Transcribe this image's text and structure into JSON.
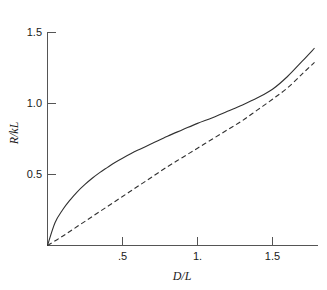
{
  "chart_data": {
    "type": "line",
    "title": "",
    "subtitle": "",
    "xlabel": "D/L",
    "ylabel": "R/kL",
    "xlim": [
      0,
      1.8
    ],
    "ylim": [
      0,
      1.5
    ],
    "grid": false,
    "legend": "none",
    "annotations": [],
    "xticks": [
      0.5,
      1.0,
      1.5
    ],
    "xtick_labels": [
      ".5",
      "1.",
      "1.5"
    ],
    "yticks": [
      0.5,
      1.0,
      1.5
    ],
    "ytick_labels": [
      "0.5",
      "1.0",
      "1.5"
    ],
    "series": [
      {
        "name": "solid-curve",
        "style": "solid",
        "color": "#303030",
        "x": [
          0,
          0.05,
          0.1,
          0.15,
          0.2,
          0.25,
          0.3,
          0.35,
          0.4,
          0.45,
          0.5,
          0.6,
          0.7,
          0.8,
          0.9,
          1.0,
          1.1,
          1.2,
          1.3,
          1.4,
          1.5,
          1.6,
          1.7,
          1.78
        ],
        "y": [
          0,
          0.16,
          0.25,
          0.32,
          0.38,
          0.43,
          0.475,
          0.515,
          0.55,
          0.585,
          0.615,
          0.67,
          0.72,
          0.77,
          0.815,
          0.86,
          0.9,
          0.945,
          0.99,
          1.04,
          1.1,
          1.19,
          1.3,
          1.39
        ]
      },
      {
        "name": "dashed-curve",
        "style": "dashed",
        "color": "#303030",
        "x": [
          0,
          0.1,
          0.2,
          0.3,
          0.4,
          0.5,
          0.6,
          0.7,
          0.8,
          0.9,
          1.0,
          1.1,
          1.2,
          1.3,
          1.4,
          1.5,
          1.6,
          1.7,
          1.78
        ],
        "y": [
          0,
          0.065,
          0.135,
          0.205,
          0.275,
          0.345,
          0.415,
          0.485,
          0.555,
          0.62,
          0.685,
          0.75,
          0.815,
          0.88,
          0.955,
          1.03,
          1.11,
          1.21,
          1.29
        ]
      }
    ]
  },
  "axes": {
    "x_axis_title": "D/L",
    "y_axis_title": "R/kL",
    "x_tick_labels": [
      ".5",
      "1.",
      "1.5"
    ],
    "y_tick_labels": [
      "1.5",
      "1.0",
      "0.5"
    ]
  }
}
